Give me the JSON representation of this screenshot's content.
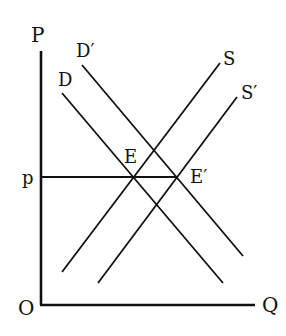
{
  "diagram": {
    "type": "supply-demand",
    "axes": {
      "y_label": "P",
      "x_label": "Q",
      "origin_label": "O"
    },
    "price_level_label": "p",
    "curves": [
      {
        "id": "D",
        "label": "D",
        "kind": "demand"
      },
      {
        "id": "D_prime",
        "label": "D′",
        "kind": "demand"
      },
      {
        "id": "S",
        "label": "S",
        "kind": "supply"
      },
      {
        "id": "S_prime",
        "label": "S′",
        "kind": "supply"
      }
    ],
    "equilibria": [
      {
        "id": "E",
        "label": "E"
      },
      {
        "id": "E_prime",
        "label": "E′"
      }
    ]
  }
}
